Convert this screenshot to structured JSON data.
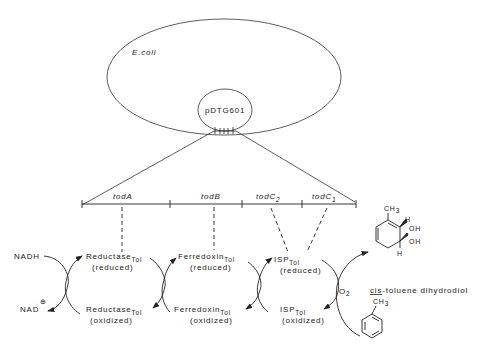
{
  "cell": {
    "label": "E.coli"
  },
  "plasmid": {
    "label": "pDTG601"
  },
  "genes": [
    {
      "name": "todA",
      "sub": ""
    },
    {
      "name": "todB",
      "sub": ""
    },
    {
      "name": "todC",
      "sub": "2"
    },
    {
      "name": "todC",
      "sub": "1"
    }
  ],
  "enzymes": {
    "reductase": {
      "name": "Reductase",
      "sub": "Tol",
      "reduced": "(reduced)",
      "oxidized": "(oxidized)"
    },
    "ferredoxin": {
      "name": "Ferredoxin",
      "sub": "Tol",
      "reduced": "(reduced)",
      "oxidized": "(oxidized)"
    },
    "isp": {
      "name": "ISP",
      "sub": "Tol",
      "reduced": "(reduced)",
      "oxidized": "(oxidized)"
    }
  },
  "cofactors": {
    "nadh": "NADH",
    "nad": "NAD",
    "nad_charge": "⊕",
    "o2": "O",
    "o2_sub": "2"
  },
  "product": {
    "prefix": "cis",
    "name": "-toluene dihydrodiol",
    "ch3": "CH",
    "ch3_sub": "3",
    "h": "H",
    "oh": "OH"
  },
  "substrate": {
    "ch3": "CH",
    "ch3_sub": "3"
  }
}
